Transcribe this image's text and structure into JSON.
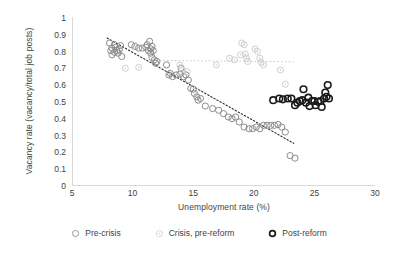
{
  "chart_data": {
    "type": "scatter",
    "title": "",
    "xlabel": "Unemployment rate (%)",
    "ylabel": "Vacancy rate (vacancy/total job posts)",
    "xlim": [
      5,
      30
    ],
    "ylim": [
      0,
      1
    ],
    "xticks": [
      "5",
      "10",
      "15",
      "20",
      "25",
      "30"
    ],
    "yticks": [
      "0",
      "0.1",
      "0.2",
      "0.3",
      "0.4",
      "0.5",
      "0.6",
      "0.7",
      "0.8",
      "0.9",
      "1"
    ],
    "grid": false,
    "legend_position": "bottom",
    "series": [
      {
        "name": "Pre-crisis",
        "marker": "open-circle",
        "color": "#8c8c8c",
        "points": [
          [
            8.1,
            0.845
          ],
          [
            8.2,
            0.8
          ],
          [
            8.3,
            0.815
          ],
          [
            8.3,
            0.775
          ],
          [
            8.5,
            0.835
          ],
          [
            8.5,
            0.79
          ],
          [
            8.6,
            0.82
          ],
          [
            8.7,
            0.8
          ],
          [
            8.8,
            0.785
          ],
          [
            8.9,
            0.805
          ],
          [
            9.0,
            0.83
          ],
          [
            9.1,
            0.765
          ],
          [
            9.9,
            0.835
          ],
          [
            10.2,
            0.825
          ],
          [
            10.5,
            0.815
          ],
          [
            10.8,
            0.815
          ],
          [
            11.1,
            0.82
          ],
          [
            11.2,
            0.835
          ],
          [
            11.3,
            0.8
          ],
          [
            11.4,
            0.855
          ],
          [
            11.5,
            0.81
          ],
          [
            11.5,
            0.785
          ],
          [
            11.6,
            0.825
          ],
          [
            11.6,
            0.76
          ],
          [
            11.7,
            0.8
          ],
          [
            11.8,
            0.745
          ],
          [
            11.9,
            0.725
          ],
          [
            12.0,
            0.735
          ],
          [
            12.8,
            0.715
          ],
          [
            13.0,
            0.655
          ],
          [
            13.1,
            0.665
          ],
          [
            13.3,
            0.645
          ],
          [
            13.6,
            0.655
          ],
          [
            13.9,
            0.66
          ],
          [
            14.0,
            0.695
          ],
          [
            14.2,
            0.645
          ],
          [
            14.4,
            0.655
          ],
          [
            14.6,
            0.625
          ],
          [
            14.8,
            0.575
          ],
          [
            15.0,
            0.57
          ],
          [
            15.1,
            0.545
          ],
          [
            15.3,
            0.525
          ],
          [
            15.4,
            0.505
          ],
          [
            15.6,
            0.515
          ],
          [
            16.0,
            0.47
          ],
          [
            16.6,
            0.455
          ],
          [
            17.1,
            0.445
          ],
          [
            17.5,
            0.425
          ],
          [
            17.9,
            0.405
          ],
          [
            18.2,
            0.395
          ],
          [
            18.5,
            0.405
          ],
          [
            18.8,
            0.375
          ],
          [
            19.2,
            0.345
          ],
          [
            19.6,
            0.335
          ],
          [
            19.9,
            0.335
          ],
          [
            20.2,
            0.345
          ],
          [
            20.5,
            0.335
          ],
          [
            20.8,
            0.355
          ],
          [
            21.1,
            0.355
          ],
          [
            21.4,
            0.355
          ],
          [
            21.7,
            0.355
          ],
          [
            22.0,
            0.36
          ],
          [
            22.3,
            0.345
          ],
          [
            22.6,
            0.315
          ],
          [
            23.0,
            0.175
          ],
          [
            23.4,
            0.16
          ]
        ],
        "trendline": {
          "type": "linear-dotted",
          "x0": 7.9,
          "y0": 0.875,
          "x1": 23.3,
          "y1": 0.248
        }
      },
      {
        "name": "Crisis, pre-reform",
        "marker": "dotted-circle",
        "color": "#cfcfcf",
        "points": [
          [
            9.4,
            0.695
          ],
          [
            10.5,
            0.7
          ],
          [
            13.9,
            0.715
          ],
          [
            14.1,
            0.685
          ],
          [
            14.5,
            0.675
          ],
          [
            16.9,
            0.715
          ],
          [
            18.0,
            0.755
          ],
          [
            18.4,
            0.745
          ],
          [
            18.9,
            0.775
          ],
          [
            19.0,
            0.845
          ],
          [
            19.2,
            0.835
          ],
          [
            19.3,
            0.78
          ],
          [
            19.4,
            0.755
          ],
          [
            19.5,
            0.735
          ],
          [
            20.1,
            0.81
          ],
          [
            20.3,
            0.795
          ],
          [
            20.5,
            0.755
          ],
          [
            20.6,
            0.73
          ],
          [
            20.8,
            0.715
          ],
          [
            22.2,
            0.685
          ],
          [
            22.6,
            0.6
          ]
        ],
        "trendline": {
          "type": "linear-dotted",
          "x0": 11.6,
          "y0": 0.742,
          "x1": 23.3,
          "y1": 0.733
        }
      },
      {
        "name": "Post-reform",
        "marker": "bold-circle",
        "color": "#1a1a1a",
        "points": [
          [
            21.6,
            0.505
          ],
          [
            22.1,
            0.515
          ],
          [
            22.4,
            0.51
          ],
          [
            22.8,
            0.515
          ],
          [
            23.1,
            0.515
          ],
          [
            23.4,
            0.475
          ],
          [
            23.6,
            0.49
          ],
          [
            23.8,
            0.5
          ],
          [
            24.0,
            0.505
          ],
          [
            24.1,
            0.57
          ],
          [
            24.3,
            0.49
          ],
          [
            24.5,
            0.52
          ],
          [
            24.6,
            0.47
          ],
          [
            24.8,
            0.5
          ],
          [
            25.0,
            0.5
          ],
          [
            25.1,
            0.475
          ],
          [
            25.3,
            0.495
          ],
          [
            25.5,
            0.5
          ],
          [
            25.6,
            0.465
          ],
          [
            25.8,
            0.515
          ],
          [
            25.9,
            0.55
          ],
          [
            26.0,
            0.525
          ],
          [
            26.1,
            0.595
          ],
          [
            26.2,
            0.515
          ]
        ]
      }
    ]
  },
  "legend": {
    "items": [
      {
        "label": "Pre-crisis",
        "marker": "open-circle-icon"
      },
      {
        "label": "Crisis, pre-reform",
        "marker": "dotted-circle-icon"
      },
      {
        "label": "Post-reform",
        "marker": "bold-circle-icon"
      }
    ]
  }
}
